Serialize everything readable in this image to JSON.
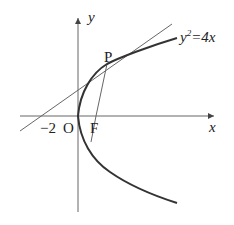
{
  "diagram": {
    "title_fragment": "",
    "equation_label": "y²=4x",
    "equation": {
      "base": "y",
      "exp": "2",
      "rest": "=4x"
    },
    "labels": {
      "y_axis": "y",
      "x_axis": "x",
      "origin": "O",
      "focus": "F",
      "point": "P",
      "intercept": "−2"
    },
    "colors": {
      "curve": "#333333",
      "line": "#555555",
      "axis": "#666666",
      "text": "#222222"
    }
  }
}
